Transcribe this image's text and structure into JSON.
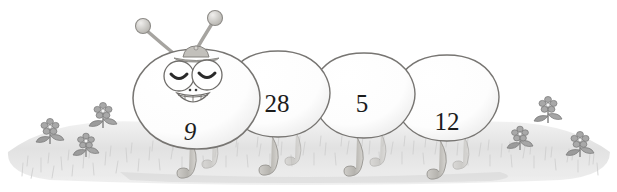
{
  "scene": {
    "title": "Numbered caterpillar on grass",
    "background_color": "#ffffff",
    "ground_color": "#e3e3e3",
    "outline_color": "#6e6e6e",
    "number_color": "#1c1c1c",
    "leg_color": "#b9b7b3",
    "flower_color": "#9a9a9a",
    "leaf_color": "#8f8f8f"
  },
  "caterpillar": {
    "segments": [
      {
        "number": "9",
        "role": "head",
        "cx": 197,
        "cy": 101,
        "rx": 62,
        "ry": 52
      },
      {
        "number": "28",
        "role": "body",
        "cx": 278,
        "cy": 98,
        "rx": 52,
        "ry": 47
      },
      {
        "number": "5",
        "role": "body",
        "cx": 364,
        "cy": 99,
        "rx": 50,
        "ry": 46
      },
      {
        "number": "12",
        "role": "tail",
        "cx": 447,
        "cy": 102,
        "rx": 52,
        "ry": 47
      }
    ],
    "face": {
      "left_eye": "closed-eye",
      "right_eye": "closed-eye",
      "mouth": "smiling-mouth-with-teeth",
      "nose": "two-dots",
      "hat": "small-cap"
    },
    "antennae": [
      {
        "side": "left",
        "tip_x": 142,
        "tip_y": 25
      },
      {
        "side": "right",
        "tip_x": 215,
        "tip_y": 17
      }
    ],
    "leg_count": 8
  },
  "flowers": {
    "left": [
      {
        "x": 50,
        "y": 128
      },
      {
        "x": 86,
        "y": 142
      },
      {
        "x": 103,
        "y": 112
      }
    ],
    "right": [
      {
        "x": 520,
        "y": 135
      },
      {
        "x": 548,
        "y": 106
      },
      {
        "x": 580,
        "y": 141
      }
    ]
  }
}
